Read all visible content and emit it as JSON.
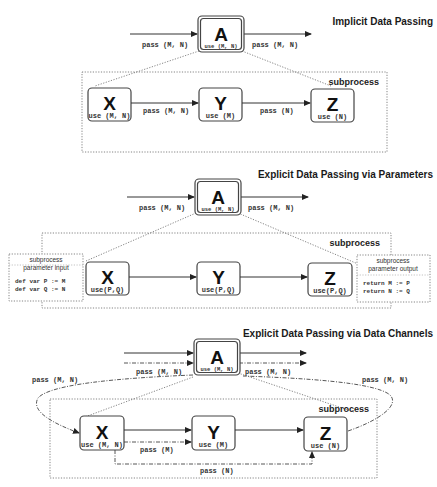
{
  "sections": [
    {
      "title": "Implicit Data Passing",
      "subprocess_label": "subprocess",
      "parent": {
        "letter": "A",
        "use": "use (M, N)"
      },
      "in_label": "pass (M, N)",
      "out_label": "pass (M, N)",
      "nodes": [
        {
          "letter": "X",
          "use": "use (M, N)"
        },
        {
          "letter": "Y",
          "use": "use (M)"
        },
        {
          "letter": "Z",
          "use": "use (N)"
        }
      ],
      "edges": [
        {
          "from": "X",
          "to": "Y",
          "label": "pass (M, N)"
        },
        {
          "from": "Y",
          "to": "Z",
          "label": "pass (N)"
        }
      ]
    },
    {
      "title": "Explicit Data Passing via Parameters",
      "subprocess_label": "subprocess",
      "parent": {
        "letter": "A",
        "use": "use (M, N)"
      },
      "in_label": "pass (M, N)",
      "out_label": "pass (M, N)",
      "nodes": [
        {
          "letter": "X",
          "use": "use(P,Q)"
        },
        {
          "letter": "Y",
          "use": "use(P,Q)"
        },
        {
          "letter": "Z",
          "use": "use(P,Q)"
        }
      ],
      "param_input": {
        "title_line1": "subprocess",
        "title_line2": "parameter input",
        "code": [
          "def var P := M",
          "def var Q := N"
        ]
      },
      "param_output": {
        "title_line1": "subprocess",
        "title_line2": "parameter output",
        "code": [
          "return M := P",
          "return N := Q"
        ]
      }
    },
    {
      "title": "Explicit Data Passing via Data Channels",
      "subprocess_label": "subprocess",
      "parent": {
        "letter": "A",
        "use": "use (M, N)"
      },
      "in_label": "pass (M, N)",
      "out_label": "pass (M, N)",
      "loop_in_label": "pass (M, N)",
      "loop_out_label": "pass (M, N)",
      "nodes": [
        {
          "letter": "X",
          "use": "use (M, N)"
        },
        {
          "letter": "Y",
          "use": "use (M)"
        },
        {
          "letter": "Z",
          "use": "use (N)"
        }
      ],
      "channels": [
        {
          "from": "X",
          "to": "Y",
          "label": "pass (M)"
        },
        {
          "from": "X",
          "to": "Z",
          "label": "pass (N)"
        }
      ]
    }
  ]
}
